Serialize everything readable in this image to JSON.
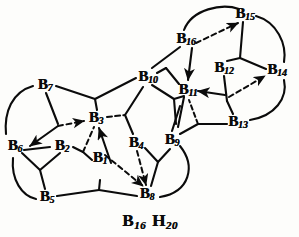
{
  "figure": {
    "formula_parts": [
      {
        "element": "B",
        "subscript": "16"
      },
      {
        "element": "H",
        "subscript": "20"
      }
    ],
    "formula_text": "B16 H20",
    "colors": {
      "ink": "#0b0b0b",
      "paper": "#fdfdfb"
    },
    "canvas": {
      "width": 299,
      "height": 237
    }
  },
  "nodes": [
    {
      "id": "B1",
      "element": "B",
      "subscript": "1",
      "x": 100,
      "y": 158
    },
    {
      "id": "B2",
      "element": "B",
      "subscript": "2",
      "x": 62,
      "y": 146
    },
    {
      "id": "B3",
      "element": "B",
      "subscript": "3",
      "x": 96,
      "y": 118
    },
    {
      "id": "B4",
      "element": "B",
      "subscript": "4",
      "x": 136,
      "y": 143
    },
    {
      "id": "B5",
      "element": "B",
      "subscript": "5",
      "x": 47,
      "y": 197
    },
    {
      "id": "B6",
      "element": "B",
      "subscript": "6",
      "x": 15,
      "y": 146
    },
    {
      "id": "B7",
      "element": "B",
      "subscript": "7",
      "x": 45,
      "y": 85
    },
    {
      "id": "B8",
      "element": "B",
      "subscript": "8",
      "x": 147,
      "y": 194
    },
    {
      "id": "B9",
      "element": "B",
      "subscript": "9",
      "x": 172,
      "y": 140
    },
    {
      "id": "B10",
      "element": "B",
      "subscript": "10",
      "x": 148,
      "y": 77
    },
    {
      "id": "B11",
      "element": "B",
      "subscript": "11",
      "x": 188,
      "y": 90
    },
    {
      "id": "B12",
      "element": "B",
      "subscript": "12",
      "x": 224,
      "y": 68
    },
    {
      "id": "B13",
      "element": "B",
      "subscript": "13",
      "x": 238,
      "y": 122
    },
    {
      "id": "B14",
      "element": "B",
      "subscript": "14",
      "x": 277,
      "y": 70
    },
    {
      "id": "B15",
      "element": "B",
      "subscript": "15",
      "x": 245,
      "y": 14
    },
    {
      "id": "B16",
      "element": "B",
      "subscript": "16",
      "x": 186,
      "y": 39
    }
  ],
  "edges": {
    "solid_bonds": [
      {
        "from": "B7",
        "to": "B3",
        "note": "B7 down-right toward B3 area via vertex"
      },
      {
        "from": "B7",
        "to": "B10",
        "note": "long upper-left chain to B10"
      },
      {
        "from": "B7",
        "to": "B6",
        "note": "curved arc on far left"
      },
      {
        "from": "B6",
        "to": "B5",
        "note": "curved arc lower left"
      },
      {
        "from": "B6",
        "to": "B2",
        "note": "short link"
      },
      {
        "from": "B2",
        "to": "B5",
        "note": "via mid vertex"
      },
      {
        "from": "B5",
        "to": "B8",
        "note": "bottom chain with mid vertex"
      },
      {
        "from": "B2",
        "to": "B1",
        "note": "short link"
      },
      {
        "from": "B1",
        "to": "B3",
        "note": "arrowed up to B3"
      },
      {
        "from": "B3",
        "to": "B10",
        "note": "upper right chain"
      },
      {
        "from": "B3",
        "to": "B4",
        "note": "via vertex"
      },
      {
        "from": "B4",
        "to": "B8",
        "note": "down to B8"
      },
      {
        "from": "B4",
        "to": "B9",
        "note": "up-right to B9"
      },
      {
        "from": "B9",
        "to": "B8",
        "note": "curved arc right of B8"
      },
      {
        "from": "B9",
        "to": "B11",
        "note": "up to B11"
      },
      {
        "from": "B9",
        "to": "B13",
        "note": "right chain to B13"
      },
      {
        "from": "B10",
        "to": "B11",
        "note": "short cluster link"
      },
      {
        "from": "B10",
        "to": "B16",
        "note": "up-right to B16"
      },
      {
        "from": "B11",
        "to": "B13",
        "note": "via vertex"
      },
      {
        "from": "B13",
        "to": "B14",
        "note": "curved arc far right"
      },
      {
        "from": "B12",
        "to": "B14",
        "note": "solid link"
      },
      {
        "from": "B12",
        "to": "B13",
        "note": "down to B13 via vertex"
      },
      {
        "from": "B12",
        "to": "B15",
        "note": "up to B15"
      },
      {
        "from": "B15",
        "to": "B14",
        "note": "curved arc right"
      },
      {
        "from": "B16",
        "to": "B15",
        "note": "curved arc over top"
      },
      {
        "from": "B13",
        "to": "B11",
        "note": "arrowed left into B11"
      }
    ],
    "dashed_arrows": [
      {
        "from": "B6",
        "to": "B3",
        "note": "dashed arrow pointing right into B3"
      },
      {
        "from": "B2",
        "to": "B3",
        "note": "dashed arrow up to B3"
      },
      {
        "from": "B3",
        "to": "B4",
        "note": "dashed short segment right of B3"
      },
      {
        "from": "B1",
        "to": "B8",
        "note": "dashed arrow down-right to B8"
      },
      {
        "from": "B4",
        "to": "B8",
        "note": "dashed arrow down to B8"
      },
      {
        "from": "B9",
        "to": "B11",
        "note": "dashed diagonal"
      },
      {
        "from": "B16",
        "to": "B15",
        "note": "dashed arrow up-right to B15"
      },
      {
        "from": "B16",
        "to": "B11",
        "note": "dashed/solid arrow down to B11"
      },
      {
        "from": "B12",
        "to": "B14",
        "note": "dashed arrow right to B14"
      }
    ],
    "solid_arrows": [
      {
        "from": "B7",
        "to": "B6",
        "note": "arrow pointing down-left into B6"
      },
      {
        "from": "B1",
        "to": "B3",
        "note": "arrow pointing up into B3"
      },
      {
        "from": "B13",
        "to": "B11",
        "note": "arrow pointing left into B11"
      },
      {
        "from": "B16",
        "to": "B11",
        "note": "arrow pointing down into B11"
      }
    ]
  },
  "legend": {
    "solid_label": "solid bond",
    "dashed_label": "dashed bond / tautomeric shift arrow"
  }
}
